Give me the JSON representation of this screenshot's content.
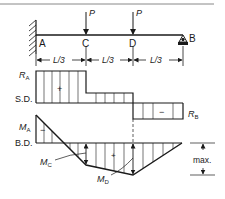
{
  "figure": {
    "type": "beam shear and bending moment diagram",
    "colors": {
      "line": "#1a1a1a",
      "background": "#ffffff",
      "rule": "#888888"
    }
  },
  "beam": {
    "points": [
      "A",
      "C",
      "D",
      "B"
    ],
    "labels": {
      "A": "A",
      "C": "C",
      "D": "D",
      "B": "B"
    },
    "loads": [
      {
        "label": "P",
        "at": "C"
      },
      {
        "label": "P",
        "at": "D"
      }
    ],
    "dimensions": [
      "L/3",
      "L/3",
      "L/3"
    ],
    "support_left": "fixed wall",
    "support_right": "pin/roller"
  },
  "shear_diagram": {
    "label": "S.D.",
    "left_reaction": "R",
    "left_reaction_sub": "A",
    "right_reaction": "R",
    "right_reaction_sub": "B",
    "sign_positive": "+",
    "sign_negative": "−"
  },
  "moment_diagram": {
    "label": "B.D.",
    "moment_a": "M",
    "moment_a_sub": "A",
    "moment_c": "M",
    "moment_c_sub": "C",
    "moment_d": "M",
    "moment_d_sub": "D",
    "sign_positive": "+",
    "sign_negative": "−",
    "max_label": "max."
  }
}
